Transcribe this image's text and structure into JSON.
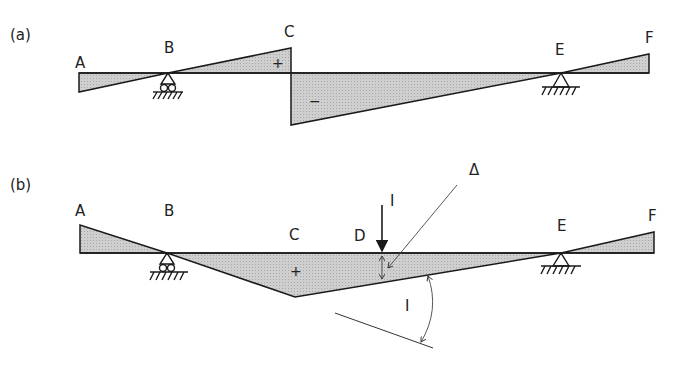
{
  "panels": [
    {
      "id": "a",
      "label": "(a)",
      "points": {
        "A": "A",
        "B": "B",
        "C": "C",
        "E": "E",
        "F": "F"
      },
      "signs": {
        "positive": "+",
        "negative": "−"
      }
    },
    {
      "id": "b",
      "label": "(b)",
      "points": {
        "A": "A",
        "B": "B",
        "C": "C",
        "D": "D",
        "E": "E",
        "F": "F"
      },
      "signs": {
        "positive": "+"
      },
      "annotations": {
        "load": "I",
        "delta": "Δ",
        "angle": "I"
      }
    }
  ],
  "colors": {
    "fill": "#c8c8c8",
    "stroke": "#1a1a1a",
    "background": "#ffffff"
  }
}
